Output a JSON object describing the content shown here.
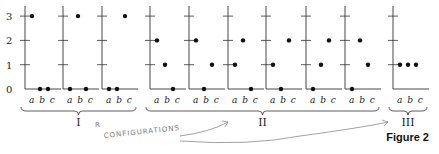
{
  "figure": {
    "caption": "Figure 2",
    "y_axis_ticks": [
      "0",
      "1",
      "2",
      "3"
    ],
    "x_labels": [
      "a",
      "b",
      "c"
    ],
    "x_label_text": "a b c",
    "groups": [
      {
        "label": "I",
        "panels": [
          [
            3,
            0,
            0
          ],
          [
            0,
            3,
            0
          ],
          [
            0,
            0,
            3
          ]
        ]
      },
      {
        "label": "II",
        "panels": [
          [
            2,
            1,
            0
          ],
          [
            2,
            0,
            1
          ],
          [
            1,
            2,
            0
          ],
          [
            1,
            0,
            2
          ],
          [
            0,
            1,
            2
          ],
          [
            0,
            2,
            1
          ]
        ]
      },
      {
        "label": "III",
        "panels": [
          [
            1,
            1,
            1
          ]
        ]
      }
    ],
    "annotation": {
      "handwritten_text": "CONFIGURATIONS",
      "mark": "R"
    },
    "colors": {
      "ink": "#1a1a1a",
      "pencil": "#8a8a8a"
    }
  },
  "chart_data": {
    "type": "scatter",
    "title": "Figure 2",
    "xlabel": "",
    "ylabel": "",
    "categories": [
      "a",
      "b",
      "c"
    ],
    "ylim": [
      0,
      3
    ],
    "y_ticks": [
      0,
      1,
      2,
      3
    ],
    "series": [
      {
        "name": "I-1",
        "group": "I",
        "values": [
          3,
          0,
          0
        ]
      },
      {
        "name": "I-2",
        "group": "I",
        "values": [
          0,
          3,
          0
        ]
      },
      {
        "name": "I-3",
        "group": "I",
        "values": [
          0,
          0,
          3
        ]
      },
      {
        "name": "II-1",
        "group": "II",
        "values": [
          2,
          1,
          0
        ]
      },
      {
        "name": "II-2",
        "group": "II",
        "values": [
          2,
          0,
          1
        ]
      },
      {
        "name": "II-3",
        "group": "II",
        "values": [
          1,
          2,
          0
        ]
      },
      {
        "name": "II-4",
        "group": "II",
        "values": [
          1,
          0,
          2
        ]
      },
      {
        "name": "II-5",
        "group": "II",
        "values": [
          0,
          1,
          2
        ]
      },
      {
        "name": "II-6",
        "group": "II",
        "values": [
          0,
          2,
          1
        ]
      },
      {
        "name": "III-1",
        "group": "III",
        "values": [
          1,
          1,
          1
        ]
      }
    ],
    "annotations": [
      "I",
      "II",
      "III",
      "CONFIGURATIONS (handwritten)"
    ]
  }
}
